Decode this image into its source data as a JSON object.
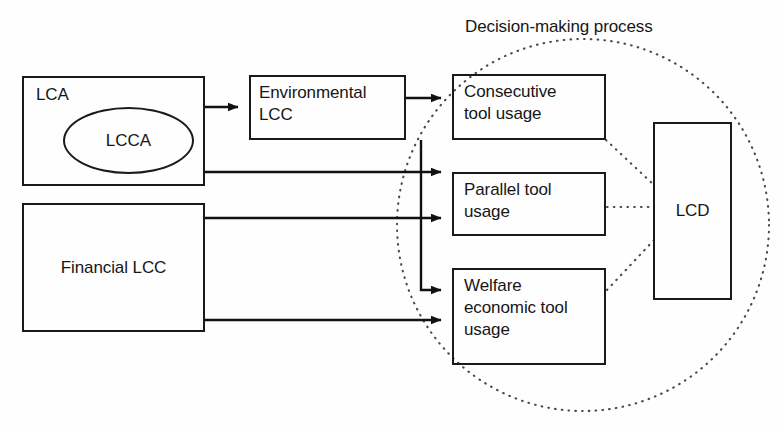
{
  "diagram": {
    "title": "Decision-making process",
    "grouping_label": "Decision-making process",
    "nodes": {
      "lca": {
        "label": "LCA"
      },
      "lcca": {
        "label": "LCCA"
      },
      "environmental_lcc": {
        "label": "Environmental\nLCC"
      },
      "financial_lcc": {
        "label": "Financial LCC"
      },
      "consecutive_tool_usage": {
        "label": "Consecutive\ntool usage"
      },
      "parallel_tool_usage": {
        "label": "Parallel tool\nusage"
      },
      "welfare_economic_tool_usage": {
        "label": "Welfare\neconomic tool\nusage"
      },
      "lcd": {
        "label": "LCD"
      }
    },
    "colors": {
      "stroke": "#1a1a1a",
      "text": "#161616",
      "dotted": "#4a4a4a",
      "background": "#fefefe"
    }
  }
}
